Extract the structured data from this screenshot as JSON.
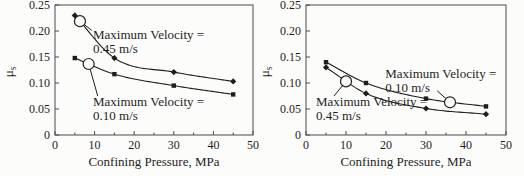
{
  "figure": {
    "background": "#fcfcfa",
    "ink": "#1e1e1e",
    "axis_color": "#4a4a4a"
  },
  "chart_data": [
    {
      "type": "line",
      "position": "left",
      "title": "",
      "xlabel": "Confining Pressure, MPa",
      "ylabel": "μ",
      "ylabel_sub": "s",
      "xlim": [
        0,
        50
      ],
      "ylim": [
        0,
        0.25
      ],
      "grid": false,
      "xticks": {
        "values": [
          0,
          10,
          20,
          30,
          40,
          50
        ],
        "labels": [
          "0",
          "10",
          "20",
          "30",
          "40",
          "50"
        ],
        "minor": [
          5,
          15,
          25,
          35,
          45
        ]
      },
      "yticks": {
        "values": [
          0,
          0.05,
          0.1,
          0.15,
          0.2,
          0.25
        ],
        "labels": [
          "0",
          "0.05",
          "0.10",
          "0.15",
          "0.20",
          "0.25"
        ]
      },
      "series": [
        {
          "name": "Maximum Velocity = 0.45 m/s",
          "marker": "diamond",
          "x": [
            5,
            15,
            30,
            45
          ],
          "y": [
            0.23,
            0.148,
            0.121,
            0.103
          ]
        },
        {
          "name": "Maximum Velocity = 0.10 m/s",
          "marker": "square",
          "x": [
            5,
            15,
            30,
            45
          ],
          "y": [
            0.148,
            0.117,
            0.095,
            0.078
          ]
        }
      ],
      "annotations": [
        {
          "lines": [
            "Maximum Velocity =",
            "0.45 m/s"
          ],
          "text_x": 9.6,
          "text_y": 0.205,
          "circle_series": 0,
          "circle_x": 6.3,
          "leader_x": 9.3,
          "leader_y": 0.201
        },
        {
          "lines": [
            "Maximum Velocity =",
            "0.10 m/s"
          ],
          "text_x": 9.6,
          "text_y": 0.0769,
          "circle_series": 1,
          "circle_x": 8.5,
          "leader_x": 10.8,
          "leader_y": 0.075
        }
      ]
    },
    {
      "type": "line",
      "position": "right",
      "title": "",
      "xlabel": "Confining Pressure, MPa",
      "ylabel": "μ",
      "ylabel_sub": "s",
      "xlim": [
        0,
        50
      ],
      "ylim": [
        0,
        0.25
      ],
      "grid": false,
      "xticks": {
        "values": [
          0,
          10,
          20,
          30,
          40,
          50
        ],
        "labels": [
          "0",
          "10",
          "20",
          "30",
          "40",
          "50"
        ],
        "minor": [
          5,
          15,
          25,
          35,
          45
        ]
      },
      "yticks": {
        "values": [
          0,
          0.05,
          0.1,
          0.15,
          0.2,
          0.25
        ],
        "labels": [
          "0",
          "0.05",
          "0.10",
          "0.15",
          "0.20",
          "0.25"
        ]
      },
      "series": [
        {
          "name": "Maximum Velocity = 0.10 m/s",
          "marker": "square",
          "x": [
            5,
            15,
            30,
            45
          ],
          "y": [
            0.14,
            0.1,
            0.07,
            0.055
          ]
        },
        {
          "name": "Maximum Velocity = 0.45 m/s",
          "marker": "diamond",
          "x": [
            5,
            15,
            30,
            45
          ],
          "y": [
            0.13,
            0.08,
            0.051,
            0.04
          ]
        }
      ],
      "annotations": [
        {
          "lines": [
            "Maximum Velocity =",
            "0.10 m/s"
          ],
          "text_x": 19.8,
          "text_y": 0.131,
          "circle_series": 0,
          "circle_x": 36,
          "leader_x": 32.8,
          "leader_y": 0.085
        },
        {
          "lines": [
            "Maximum Velocity =",
            "0.45 m/s"
          ],
          "text_x": 2.5,
          "text_y": 0.0769,
          "circle_series": 1,
          "circle_x": 10,
          "leader_x": 7.0,
          "leader_y": 0.075
        }
      ]
    }
  ]
}
